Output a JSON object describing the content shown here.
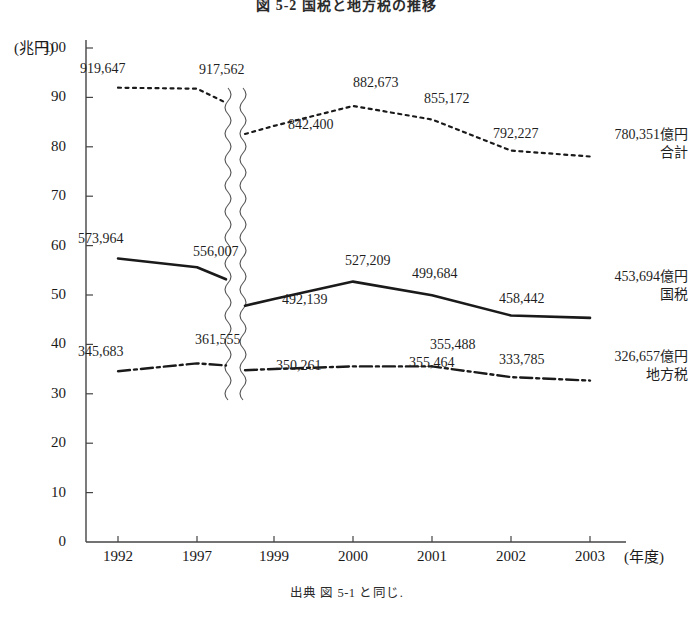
{
  "figure": {
    "title": "図 5-2  国税と地方税の推移",
    "source_note": "出典  図 5-1 と同じ."
  },
  "chart_data": {
    "type": "line",
    "title": "図 5-2  国税と地方税の推移",
    "xlabel": "(年度)",
    "ylabel": "(兆円)",
    "unit_note": "金額は億円，軸は兆円",
    "ylim": [
      0,
      100
    ],
    "yticks": [
      0,
      10,
      20,
      30,
      40,
      50,
      60,
      70,
      80,
      90,
      100
    ],
    "ytick_labels": [
      "0",
      "10",
      "20",
      "30",
      "40",
      "50",
      "60",
      "70",
      "80",
      "90",
      "100"
    ],
    "categories": [
      "1992",
      "1997",
      "1999",
      "2000",
      "2001",
      "2002",
      "2003"
    ],
    "axis_break": {
      "present": true,
      "between": [
        "1997",
        "1999"
      ],
      "style": "double-wavy"
    },
    "grid": false,
    "legend_position": "right-inline-labels",
    "series": [
      {
        "name": "合計",
        "style": "dotted",
        "color": "#1a1a1a",
        "labels_oku": [
          "919,647",
          "917,562",
          "842,400",
          "882,673",
          "855,172",
          "792,227",
          "780,351"
        ],
        "values_cho": [
          91.9647,
          91.7562,
          84.24,
          88.2673,
          85.5172,
          79.2227,
          78.0351
        ],
        "end_label_value": "780,351億円",
        "end_label_name": "合計"
      },
      {
        "name": "国税",
        "style": "solid",
        "color": "#1a1a1a",
        "labels_oku": [
          "573,964",
          "556,007",
          "492,139",
          "527,209",
          "499,684",
          "458,442",
          "453,694"
        ],
        "values_cho": [
          57.3964,
          55.6007,
          49.2139,
          52.7209,
          49.9684,
          45.8442,
          45.3694
        ],
        "end_label_value": "453,694億円",
        "end_label_name": "国税"
      },
      {
        "name": "地方税",
        "style": "dash-dot",
        "color": "#1a1a1a",
        "labels_oku": [
          "345,683",
          "361,555",
          "350,261",
          "355,464",
          "355,488",
          "333,785",
          "326,657"
        ],
        "values_cho": [
          34.5683,
          36.1555,
          35.0261,
          35.5464,
          35.5488,
          33.3785,
          32.6657
        ],
        "end_label_value": "326,657億円",
        "end_label_name": "地方税"
      }
    ]
  }
}
